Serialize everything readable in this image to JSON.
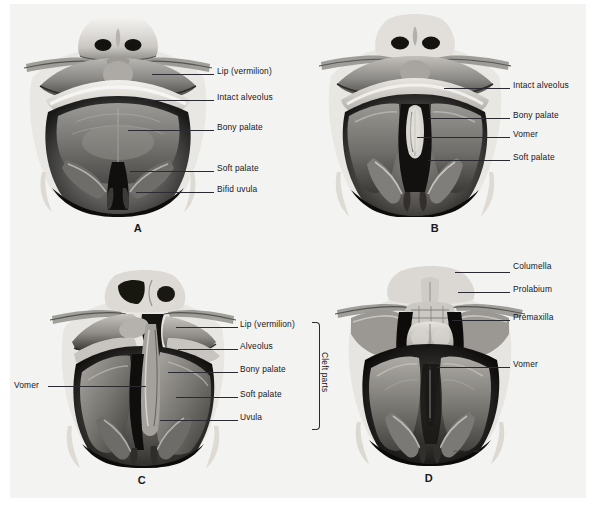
{
  "figure": {
    "background_color": "#f3f3f1",
    "ink_color": "#16161c",
    "panels": [
      {
        "letter": "A",
        "description": "Intact lip and alveolus with cleft of soft palate and bifid uvula",
        "labels": [
          {
            "text": "Lip (vermilion)",
            "side": "right"
          },
          {
            "text": "Intact alveolus",
            "side": "right"
          },
          {
            "text": "Bony palate",
            "side": "right"
          },
          {
            "text": "Soft palate",
            "side": "right"
          },
          {
            "text": "Bifid uvula",
            "side": "right"
          }
        ]
      },
      {
        "letter": "B",
        "description": "Intact alveolus with cleft of secondary palate exposing vomer",
        "labels": [
          {
            "text": "Intact alveolus",
            "side": "right"
          },
          {
            "text": "Bony palate",
            "side": "right"
          },
          {
            "text": "Vomer",
            "side": "right"
          },
          {
            "text": "Soft palate",
            "side": "right"
          }
        ]
      },
      {
        "letter": "C",
        "description": "Unilateral complete cleft of lip, alveolus and palate",
        "bracket_label": "Cleft parts",
        "labels": [
          {
            "text": "Vomer",
            "side": "left"
          },
          {
            "text": "Lip (vermilion)",
            "side": "right"
          },
          {
            "text": "Alveolus",
            "side": "right"
          },
          {
            "text": "Bony palate",
            "side": "right"
          },
          {
            "text": "Soft palate",
            "side": "right"
          },
          {
            "text": "Uvula",
            "side": "right"
          }
        ]
      },
      {
        "letter": "D",
        "description": "Bilateral complete cleft with protruding premaxilla and prolabium",
        "labels": [
          {
            "text": "Columella",
            "side": "right"
          },
          {
            "text": "Prolabium",
            "side": "right"
          },
          {
            "text": "Premaxilla",
            "side": "right"
          },
          {
            "text": "Vomer",
            "side": "right"
          }
        ]
      }
    ]
  }
}
